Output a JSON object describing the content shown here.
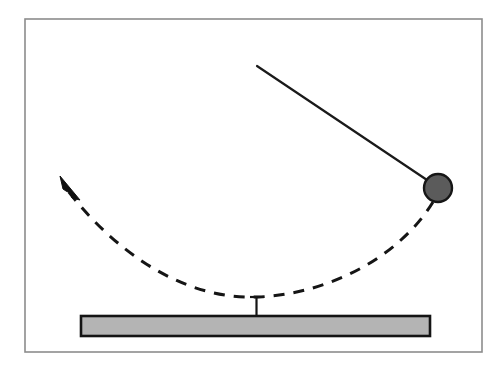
{
  "figure": {
    "type": "physics-diagram",
    "canvas": {
      "width": 504,
      "height": 370,
      "background": "#ffffff"
    }
  },
  "frame": {
    "name": "outer-border",
    "x": 25,
    "y": 19,
    "width": 457,
    "height": 333,
    "stroke": "#8c8c8c",
    "stroke_width": 1.6,
    "fill": "none"
  },
  "pendulum": {
    "rod": {
      "label": "pendulum-rod",
      "x1": 257,
      "y1": 66,
      "x2": 433,
      "y2": 184,
      "stroke": "#1a1a1a",
      "stroke_width": 2.2
    },
    "bob": {
      "label": "pendulum-bob",
      "cx": 438,
      "cy": 188,
      "r": 14,
      "fill": "#5b5b5b",
      "stroke": "#161616",
      "stroke_width": 2.4
    },
    "anchor_point": {
      "x": 257,
      "y": 66
    }
  },
  "trajectory": {
    "label": "swing-arc",
    "path": "M 433 202 C 400 256 330 294 258 297 C 186 300 118 255 68 191",
    "stroke": "#151515",
    "stroke_width": 3,
    "dash_pattern": "11 9",
    "lowest_point": {
      "x": 258,
      "y": 297
    },
    "direction": "counter-clockwise toward upper-left"
  },
  "arrow": {
    "label": "direction-arrow",
    "points": "60,176 80,200 72,198 70,193 66,191 63,189",
    "tip": {
      "x": 60,
      "y": 176
    },
    "fill": "#101010",
    "stroke": "#101010",
    "stroke_width": 1
  },
  "stand": {
    "post": {
      "label": "pivot-post",
      "x": 256.5,
      "y_top": 297,
      "y_bottom": 317,
      "stroke": "#151515",
      "stroke_width": 2.2
    },
    "post_cap": {
      "label": "post-cap",
      "x1": 250,
      "x2": 264,
      "y": 297,
      "stroke": "#151515",
      "stroke_width": 2.2
    },
    "base": {
      "label": "base-bar",
      "x": 81,
      "y": 316,
      "width": 349,
      "height": 20,
      "fill": "#b4b4b4",
      "stroke": "#141414",
      "stroke_width": 2.6
    }
  },
  "colors": {
    "bob_fill": "#5b5b5b",
    "base_fill": "#b4b4b4",
    "line": "#151515",
    "frame": "#8c8c8c",
    "background": "#ffffff"
  }
}
